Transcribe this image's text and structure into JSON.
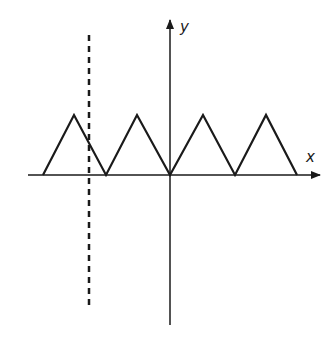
{
  "diagram": {
    "type": "function-graph",
    "axes": {
      "x_label": "x",
      "y_label": "y"
    },
    "colors": {
      "stroke": "#1a1a1a",
      "background": "#ffffff"
    },
    "triangle_wave": {
      "zeros_px_x": [
        43,
        106,
        170,
        235,
        297
      ],
      "peaks_px_x": [
        74,
        137,
        203,
        266
      ],
      "baseline_px_y": 175,
      "peak_px_y": 115
    },
    "dashed_line": {
      "x_px": 89,
      "y_start_px": 35,
      "y_end_px": 308
    }
  }
}
